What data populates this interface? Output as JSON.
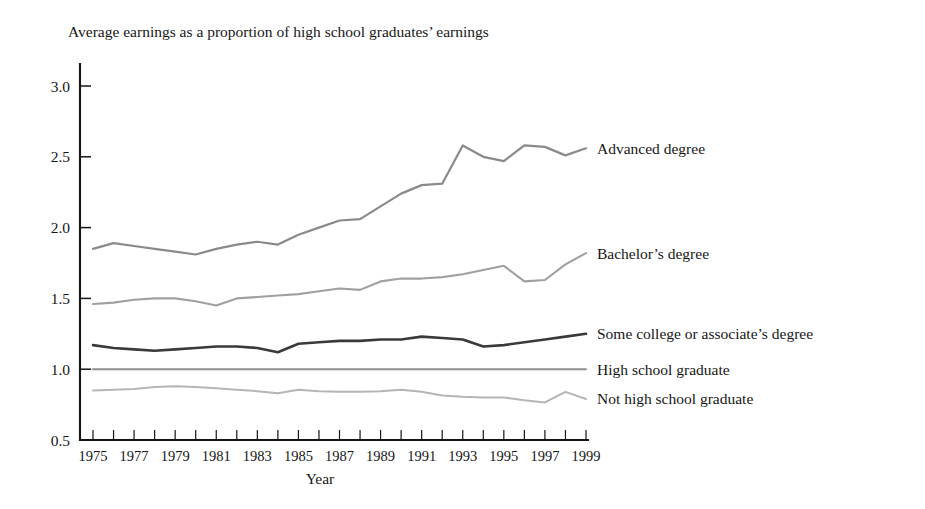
{
  "chart_data": {
    "type": "line",
    "title": "Average earnings as a proportion of high school graduates’ earnings",
    "subtitle": "",
    "xlabel": "Year",
    "ylabel": "",
    "xlim": [
      1975,
      1999
    ],
    "ylim": [
      0.5,
      3.0
    ],
    "grid": false,
    "legend_position": "right-inline-labels",
    "y_ticks": [
      "0.5",
      "1.0",
      "1.5",
      "2.0",
      "2.5",
      "3.0"
    ],
    "y_tick_values": [
      0.5,
      1.0,
      1.5,
      2.0,
      2.5,
      3.0
    ],
    "x_ticks": [
      "1975",
      "1977",
      "1979",
      "1981",
      "1983",
      "1985",
      "1987",
      "1989",
      "1991",
      "1993",
      "1995",
      "1997",
      "1999"
    ],
    "x_tick_values": [
      1975,
      1977,
      1979,
      1981,
      1983,
      1985,
      1987,
      1989,
      1991,
      1993,
      1995,
      1997,
      1999
    ],
    "x": [
      1975,
      1976,
      1977,
      1978,
      1979,
      1980,
      1981,
      1982,
      1983,
      1984,
      1985,
      1986,
      1987,
      1988,
      1989,
      1990,
      1991,
      1992,
      1993,
      1994,
      1995,
      1996,
      1997,
      1998,
      1999
    ],
    "series": [
      {
        "name": "Advanced degree",
        "color": "#8a8a8a",
        "width": 2.2,
        "label_y_value": 2.56,
        "values": [
          1.85,
          1.89,
          1.87,
          1.85,
          1.83,
          1.81,
          1.85,
          1.88,
          1.9,
          1.88,
          1.95,
          2.0,
          2.05,
          2.06,
          2.15,
          2.24,
          2.3,
          2.31,
          2.58,
          2.5,
          2.47,
          2.58,
          2.57,
          2.51,
          2.56
        ]
      },
      {
        "name": "Bachelor’s degree",
        "color": "#a0a0a0",
        "width": 2.1,
        "label_y_value": 1.82,
        "values": [
          1.46,
          1.47,
          1.49,
          1.5,
          1.5,
          1.48,
          1.45,
          1.5,
          1.51,
          1.52,
          1.53,
          1.55,
          1.57,
          1.56,
          1.62,
          1.64,
          1.64,
          1.65,
          1.67,
          1.7,
          1.73,
          1.62,
          1.63,
          1.74,
          1.82
        ]
      },
      {
        "name": "Some college or associate’s degree",
        "color": "#3a3a3a",
        "width": 2.6,
        "label_y_value": 1.25,
        "values": [
          1.17,
          1.15,
          1.14,
          1.13,
          1.14,
          1.15,
          1.16,
          1.16,
          1.15,
          1.12,
          1.18,
          1.19,
          1.2,
          1.2,
          1.21,
          1.21,
          1.23,
          1.22,
          1.21,
          1.16,
          1.17,
          1.19,
          1.21,
          1.23,
          1.25
        ]
      },
      {
        "name": "High school graduate",
        "color": "#8f8f8f",
        "width": 2.0,
        "label_y_value": 1.0,
        "values": [
          1.0,
          1.0,
          1.0,
          1.0,
          1.0,
          1.0,
          1.0,
          1.0,
          1.0,
          1.0,
          1.0,
          1.0,
          1.0,
          1.0,
          1.0,
          1.0,
          1.0,
          1.0,
          1.0,
          1.0,
          1.0,
          1.0,
          1.0,
          1.0,
          1.0
        ]
      },
      {
        "name": "Not high school graduate",
        "color": "#b5b5b5",
        "width": 2.0,
        "label_y_value": 0.79,
        "values": [
          0.85,
          0.855,
          0.86,
          0.875,
          0.88,
          0.875,
          0.865,
          0.855,
          0.845,
          0.83,
          0.855,
          0.845,
          0.84,
          0.84,
          0.845,
          0.855,
          0.84,
          0.815,
          0.805,
          0.8,
          0.8,
          0.78,
          0.765,
          0.84,
          0.79
        ]
      }
    ]
  }
}
